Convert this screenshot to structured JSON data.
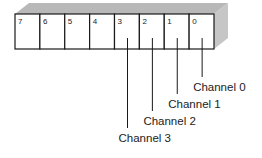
{
  "diagram": {
    "type": "channel-register",
    "colors": {
      "top_face": "#b8b8b8",
      "side_face": "#c6c6c6",
      "front_face": "#ffffff",
      "stroke": "#1a1a1a"
    },
    "cells": [
      {
        "label": "7"
      },
      {
        "label": "6"
      },
      {
        "label": "5"
      },
      {
        "label": "4"
      },
      {
        "label": "3"
      },
      {
        "label": "2"
      },
      {
        "label": "1"
      },
      {
        "label": "0"
      }
    ],
    "channels": [
      {
        "label": "Channel 0",
        "cell": "0"
      },
      {
        "label": "Channel 1",
        "cell": "1"
      },
      {
        "label": "Channel 2",
        "cell": "2"
      },
      {
        "label": "Channel 3",
        "cell": "3"
      }
    ]
  }
}
